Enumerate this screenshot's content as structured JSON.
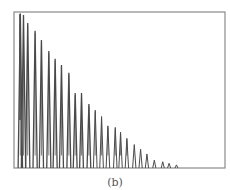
{
  "caption": "(b)",
  "colors": {
    "frame": "#8a8a8a",
    "signal": "#4a4a4a",
    "background": "#ffffff"
  },
  "chart_data": {
    "type": "line",
    "title": "",
    "subtitle": "(b)",
    "xlabel": "",
    "ylabel": "",
    "grid": false,
    "legend": null,
    "ylim": [
      0,
      1
    ],
    "xlim": [
      0,
      1
    ],
    "peaks": {
      "x": [
        0.03,
        0.045,
        0.065,
        0.1,
        0.13,
        0.165,
        0.195,
        0.225,
        0.26,
        0.29,
        0.32,
        0.355,
        0.385,
        0.415,
        0.445,
        0.48,
        0.505,
        0.535,
        0.57,
        0.6,
        0.63,
        0.665,
        0.705,
        0.735,
        0.77
      ],
      "values": [
        0.99,
        0.98,
        0.93,
        0.88,
        0.82,
        0.75,
        0.7,
        0.66,
        0.61,
        0.48,
        0.48,
        0.41,
        0.37,
        0.33,
        0.27,
        0.26,
        0.23,
        0.19,
        0.15,
        0.12,
        0.09,
        0.05,
        0.04,
        0.03,
        0.02
      ]
    },
    "axis_ranges_px": {
      "left": 14,
      "right": 225,
      "top": 12,
      "bottom": 168
    }
  }
}
